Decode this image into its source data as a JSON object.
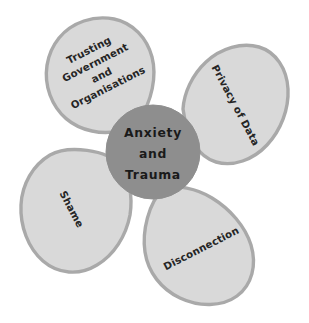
{
  "diagram": {
    "type": "radial-petal-diagram",
    "background_color": "#ffffff",
    "center": {
      "label_lines": [
        "Anxiety",
        "and",
        "Trauma"
      ],
      "line1": "Anxiety",
      "line2": "and",
      "line3": "Trauma",
      "fill_color": "#8e8e8e",
      "text_color": "#1a1a1a"
    },
    "petal_style": {
      "fill_color": "#d9d9d9",
      "stroke_color": "#a9a9a9",
      "text_color": "#252525"
    },
    "petals": [
      {
        "id": "trusting-government-and-organisations",
        "position": "top-left",
        "rotation_deg": -27,
        "label_lines": [
          "Trusting",
          "Government",
          "and",
          "Organisations"
        ],
        "line1": "Trusting",
        "line2": "Government",
        "line3": "and",
        "line4": "Organisations"
      },
      {
        "id": "privacy-of-data",
        "position": "right",
        "rotation_deg": 62,
        "label_lines": [
          "Privacy of Data"
        ],
        "line1": "Privacy of Data"
      },
      {
        "id": "disconnection",
        "position": "bottom-right",
        "rotation_deg": -27,
        "label_lines": [
          "Disconnection"
        ],
        "line1": "Disconnection"
      },
      {
        "id": "shame",
        "position": "left",
        "rotation_deg": 62,
        "label_lines": [
          "Shame"
        ],
        "line1": "Shame"
      }
    ]
  }
}
